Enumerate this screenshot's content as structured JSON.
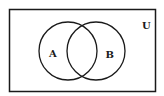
{
  "diagram": {
    "type": "venn",
    "universe_label": "U",
    "sets": [
      {
        "label": "A",
        "cx": 68,
        "cy": 51,
        "r": 29
      },
      {
        "label": "B",
        "cx": 96,
        "cy": 51,
        "r": 29
      }
    ],
    "universe_rect": {
      "x": 9.5,
      "y": 9.5,
      "width": 146,
      "height": 82
    },
    "stroke_color": "#1a1a1a",
    "background_color": "#ffffff"
  }
}
